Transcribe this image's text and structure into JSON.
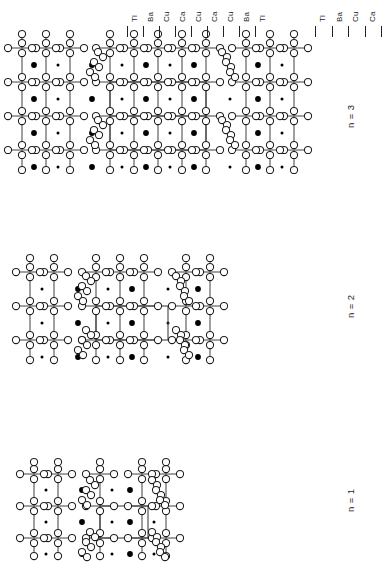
{
  "figure": {
    "type": "crystal-structure-diagram",
    "orientation": "rotated-90-ccw",
    "background": "#ffffff",
    "atom_colors": {
      "oxygen_open_circle": "#ffffff",
      "cation_filled_dot": "#000000",
      "bond": "#4a4a4a",
      "unit_cell": "#3b3b3b"
    }
  },
  "panels": [
    {
      "id": "n3",
      "caption": "n = 3",
      "layer_labels": [
        "Tl",
        "Ba",
        "Cu",
        "Ca",
        "Cu",
        "Ca",
        "Cu",
        "Ba",
        "Tl"
      ],
      "tick_count": 9
    },
    {
      "id": "n2",
      "caption": "n = 2",
      "layer_labels": [
        "Tl",
        "Ba",
        "Cu",
        "Ca",
        "Cu",
        "Ba",
        "Tl"
      ],
      "tick_count": 7
    },
    {
      "id": "n1",
      "caption": "n = 1",
      "layer_labels": [
        "Tl",
        "Ba",
        "Cu",
        "Ba",
        "Tl"
      ],
      "tick_count": 5
    }
  ]
}
